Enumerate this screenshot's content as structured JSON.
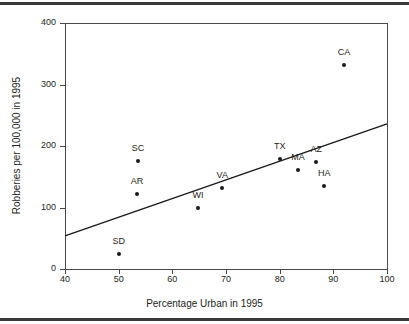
{
  "chart_data": {
    "type": "scatter",
    "title": "",
    "xlabel": "Percentage Urban in 1995",
    "ylabel": "Robberies per 100,000 in 1995",
    "xlim": [
      40,
      100
    ],
    "ylim": [
      0,
      400
    ],
    "xticks": [
      40,
      50,
      60,
      70,
      80,
      90,
      100
    ],
    "xtick_labels": [
      "40",
      "50",
      "60",
      "70",
      "80",
      "90",
      "100"
    ],
    "yticks": [
      0,
      100,
      200,
      300,
      400
    ],
    "ytick_labels": [
      "0",
      "100",
      "200",
      "300",
      "400"
    ],
    "grid": false,
    "legend": "none",
    "points": [
      {
        "label": "SD",
        "x": 50.0,
        "y": 24,
        "label_dx": 0,
        "label_dy": -12
      },
      {
        "label": "AR",
        "x": 53.4,
        "y": 122,
        "label_dx": 0,
        "label_dy": -12
      },
      {
        "label": "SC",
        "x": 53.6,
        "y": 176,
        "label_dx": 0,
        "label_dy": -12
      },
      {
        "label": "WI",
        "x": 64.8,
        "y": 99,
        "label_dx": 0,
        "label_dy": -12
      },
      {
        "label": "VA",
        "x": 69.3,
        "y": 132,
        "label_dx": 0,
        "label_dy": -12
      },
      {
        "label": "TX",
        "x": 80.0,
        "y": 179,
        "label_dx": 0,
        "label_dy": -12
      },
      {
        "label": "MA",
        "x": 83.4,
        "y": 161,
        "label_dx": 0,
        "label_dy": -12
      },
      {
        "label": "AZ",
        "x": 86.8,
        "y": 174,
        "label_dx": 0,
        "label_dy": -12
      },
      {
        "label": "HA",
        "x": 88.3,
        "y": 135,
        "label_dx": 0,
        "label_dy": -12
      },
      {
        "label": "CA",
        "x": 92.0,
        "y": 332,
        "label_dx": 0,
        "label_dy": -12
      }
    ],
    "fit_line": {
      "name": "regression line",
      "x1": 40,
      "y1": 54,
      "x2": 100,
      "y2": 236,
      "color": "#1a1a1a"
    }
  },
  "colors": {
    "point": "#1a1a1a",
    "axis": "#4a4a4c",
    "rule": "#3a3a3c",
    "text": "#231f20",
    "background": "#ffffff"
  }
}
